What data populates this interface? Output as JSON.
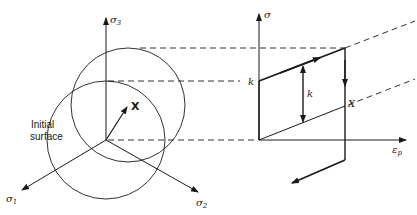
{
  "figure": {
    "left_panel": {
      "axes": {
        "sigma1": "σ",
        "sigma1_sub": "1",
        "sigma2": "σ",
        "sigma2_sub": "2",
        "sigma3": "σ",
        "sigma3_sub": "3"
      },
      "back_stress_label": "X",
      "initial_surface_label_line1": "Initial",
      "initial_surface_label_line2": "surface"
    },
    "right_panel": {
      "y_axis_label": "σ",
      "x_axis_label": "ε",
      "x_axis_sub": "p",
      "k_intercept_label": "k",
      "k_span_label": "k",
      "back_stress_label": "X"
    }
  }
}
